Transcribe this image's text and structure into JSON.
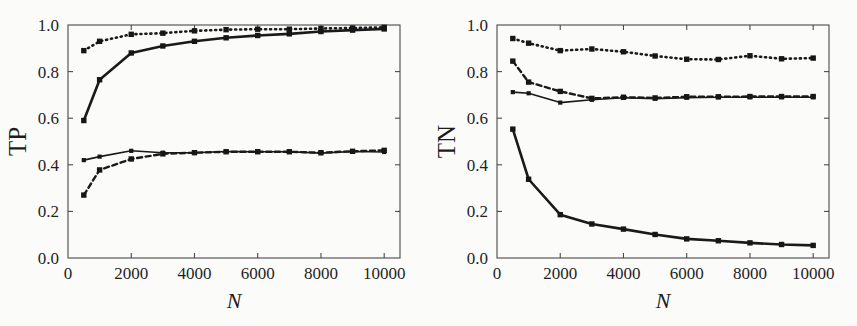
{
  "figure": {
    "background_color": "#fbfbfa",
    "ink_color": "#1a1a1a",
    "panel_count": 2
  },
  "chart_data": [
    {
      "type": "line",
      "title": "",
      "panel_name": "TP",
      "xlabel": "N",
      "ylabel": "TP",
      "xlim": [
        0,
        10500
      ],
      "ylim": [
        0.0,
        1.0
      ],
      "grid": false,
      "legend_position": "none",
      "xticks": [
        0,
        2000,
        4000,
        6000,
        8000,
        10000
      ],
      "xticklabels": [
        "0",
        "2000",
        "4000",
        "6000",
        "8000",
        "10000"
      ],
      "yticks": [
        0.0,
        0.2,
        0.4,
        0.6,
        0.8,
        1.0
      ],
      "yticklabels": [
        "0.0",
        "0.2",
        "0.4",
        "0.6",
        "0.8",
        "1.0"
      ],
      "x": [
        500,
        1000,
        2000,
        3000,
        4000,
        5000,
        6000,
        7000,
        8000,
        9000,
        10000
      ],
      "series": [
        {
          "name": "dotted-upper",
          "style": "dotted",
          "width": 2.6,
          "values": [
            0.89,
            0.93,
            0.96,
            0.965,
            0.975,
            0.98,
            0.982,
            0.982,
            0.985,
            0.987,
            0.99
          ]
        },
        {
          "name": "solid-thick-upper",
          "style": "solid",
          "width": 2.6,
          "values": [
            0.59,
            0.765,
            0.88,
            0.91,
            0.93,
            0.945,
            0.955,
            0.962,
            0.972,
            0.978,
            0.983
          ]
        },
        {
          "name": "solid-thin-lower",
          "style": "solid",
          "width": 1.6,
          "values": [
            0.42,
            0.435,
            0.46,
            0.452,
            0.452,
            0.457,
            0.456,
            0.456,
            0.45,
            0.457,
            0.455
          ]
        },
        {
          "name": "dashed-lower",
          "style": "dashed",
          "width": 2.4,
          "values": [
            0.27,
            0.378,
            0.425,
            0.447,
            0.452,
            0.456,
            0.456,
            0.456,
            0.452,
            0.458,
            0.462
          ]
        }
      ]
    },
    {
      "type": "line",
      "title": "",
      "panel_name": "TN",
      "xlabel": "N",
      "ylabel": "TN",
      "xlim": [
        0,
        10500
      ],
      "ylim": [
        0.0,
        1.0
      ],
      "grid": false,
      "legend_position": "none",
      "xticks": [
        0,
        2000,
        4000,
        6000,
        8000,
        10000
      ],
      "xticklabels": [
        "0",
        "2000",
        "4000",
        "6000",
        "8000",
        "10000"
      ],
      "yticks": [
        0.0,
        0.2,
        0.4,
        0.6,
        0.8,
        1.0
      ],
      "yticklabels": [
        "0.0",
        "0.2",
        "0.4",
        "0.6",
        "0.8",
        "1.0"
      ],
      "x": [
        500,
        1000,
        2000,
        3000,
        4000,
        5000,
        6000,
        7000,
        8000,
        9000,
        10000
      ],
      "series": [
        {
          "name": "dotted-upper",
          "style": "dotted",
          "width": 2.6,
          "values": [
            0.942,
            0.922,
            0.89,
            0.897,
            0.885,
            0.867,
            0.853,
            0.852,
            0.868,
            0.855,
            0.858
          ]
        },
        {
          "name": "dashed-middle",
          "style": "dashed",
          "width": 2.4,
          "values": [
            0.845,
            0.755,
            0.715,
            0.685,
            0.69,
            0.687,
            0.692,
            0.692,
            0.693,
            0.693,
            0.693
          ]
        },
        {
          "name": "solid-thin-middle",
          "style": "solid",
          "width": 1.6,
          "values": [
            0.712,
            0.707,
            0.667,
            0.679,
            0.688,
            0.684,
            0.688,
            0.69,
            0.69,
            0.69,
            0.69
          ]
        },
        {
          "name": "solid-thick-lower",
          "style": "solid",
          "width": 2.6,
          "values": [
            0.553,
            0.338,
            0.186,
            0.146,
            0.124,
            0.101,
            0.082,
            0.074,
            0.065,
            0.058,
            0.054
          ]
        }
      ]
    }
  ]
}
